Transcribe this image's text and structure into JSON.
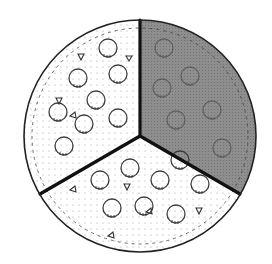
{
  "diagram": {
    "type": "circle-divided-into-thirds",
    "sectors": [
      {
        "name": "top-left-sector",
        "shaded": false
      },
      {
        "name": "right-sector",
        "shaded": true
      },
      {
        "name": "bottom-sector",
        "shaded": false
      }
    ],
    "shaded_fraction": "1/3",
    "colors": {
      "outline": "#222222",
      "shade": "#8a8a8a",
      "background": "#ffffff"
    }
  }
}
